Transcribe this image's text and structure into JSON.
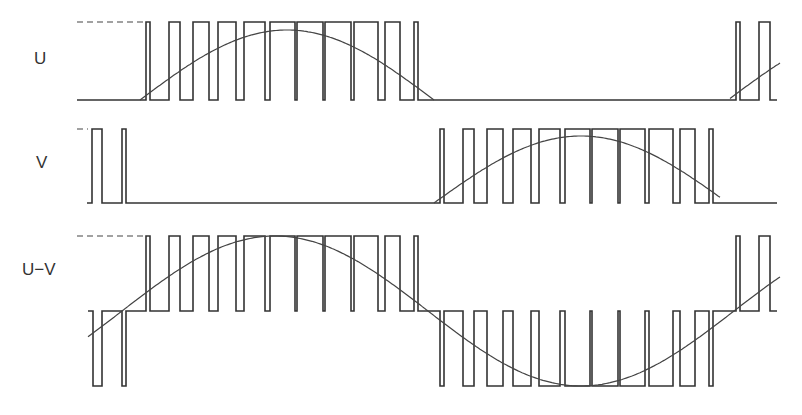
{
  "diagram": {
    "title": "",
    "rows": [
      {
        "id": "U",
        "label": "U",
        "label_pos": [
          34,
          64
        ],
        "type": "unipolar",
        "high_y": 22,
        "low_y": 100,
        "x_start": 77,
        "x_end": 777,
        "dash": [
          77,
          145,
          22
        ],
        "pulses": [
          [
            146,
            150
          ],
          [
            169,
            180
          ],
          [
            193,
            209
          ],
          [
            218,
            236
          ],
          [
            244,
            265
          ],
          [
            270,
            295
          ],
          [
            297,
            323
          ],
          [
            325,
            351
          ],
          [
            354,
            378
          ],
          [
            385,
            400
          ],
          [
            414,
            418
          ],
          [
            736,
            740
          ],
          [
            759,
            770
          ]
        ],
        "sine": {
          "amplitude": 70,
          "center_y": 100,
          "period_start": 140,
          "half_period": 294,
          "x_from": 140,
          "x_to": 780,
          "clip_negative": true
        }
      },
      {
        "id": "V",
        "label": "V",
        "label_pos": [
          36,
          168
        ],
        "type": "unipolar",
        "high_y": 129,
        "low_y": 203,
        "x_start": 87,
        "x_end": 777,
        "dash": [
          77,
          88,
          129
        ],
        "pulses": [
          [
            92,
            102
          ],
          [
            122,
            126
          ],
          [
            440,
            444
          ],
          [
            463,
            474
          ],
          [
            487,
            503
          ],
          [
            513,
            531
          ],
          [
            539,
            560
          ],
          [
            565,
            590
          ],
          [
            592,
            618
          ],
          [
            620,
            645
          ],
          [
            649,
            673
          ],
          [
            680,
            695
          ],
          [
            709,
            713
          ]
        ],
        "sine": {
          "amplitude": 67,
          "center_y": 203,
          "period_start": 434,
          "half_period": 294,
          "x_from": 434,
          "x_to": 720,
          "clip_negative": true
        }
      },
      {
        "id": "UV",
        "label": "U−V",
        "label_pos": [
          22,
          275
        ],
        "type": "bipolar",
        "high_y": 236,
        "zero_y": 311,
        "low_y": 386,
        "x_start": 88,
        "x_end": 777,
        "dash": [
          77,
          145,
          236
        ],
        "pos_pulses": [
          [
            146,
            150
          ],
          [
            169,
            180
          ],
          [
            193,
            209
          ],
          [
            218,
            236
          ],
          [
            244,
            265
          ],
          [
            270,
            295
          ],
          [
            297,
            323
          ],
          [
            325,
            351
          ],
          [
            354,
            378
          ],
          [
            385,
            400
          ],
          [
            414,
            418
          ],
          [
            736,
            740
          ],
          [
            759,
            770
          ]
        ],
        "neg_pulses": [
          [
            93,
            102
          ],
          [
            122,
            126
          ],
          [
            440,
            444
          ],
          [
            463,
            474
          ],
          [
            487,
            503
          ],
          [
            513,
            531
          ],
          [
            539,
            560
          ],
          [
            565,
            590
          ],
          [
            592,
            618
          ],
          [
            620,
            645
          ],
          [
            649,
            673
          ],
          [
            680,
            695
          ],
          [
            709,
            713
          ]
        ],
        "sine": {
          "amplitude": 70,
          "center_y": 311,
          "phase_zero_x": 140,
          "half_period": 294,
          "x_from": 88,
          "x_to": 780,
          "slope_hint": "fundamental of line-to-line voltage"
        }
      }
    ]
  },
  "colors": {
    "stroke": "#333333",
    "background": "#ffffff"
  }
}
